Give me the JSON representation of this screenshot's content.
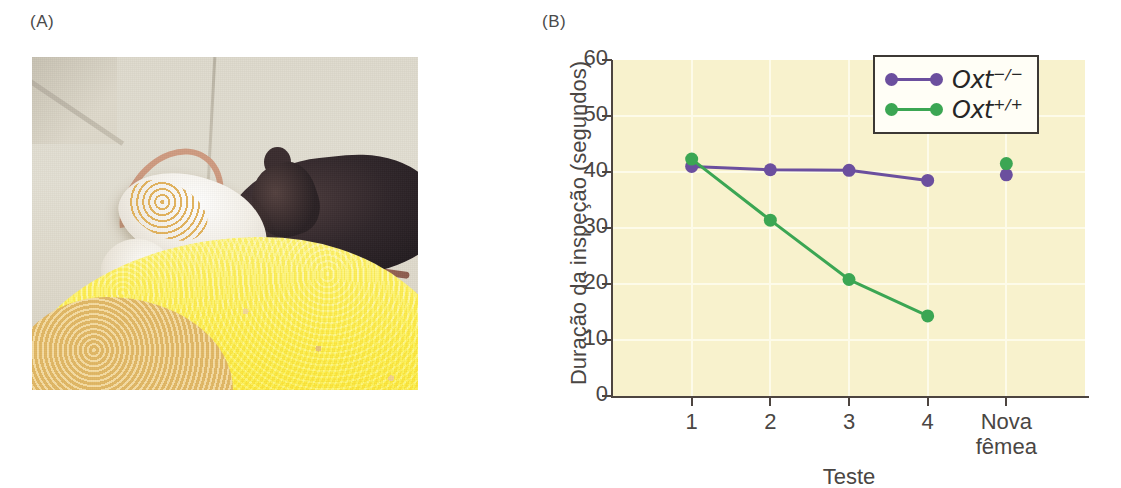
{
  "panels": {
    "a": {
      "label": "(A)",
      "image_description": "Fotografia de um camundongo branco e um camundongo escuro sobre maravalha"
    },
    "b": {
      "label": "(B)"
    }
  },
  "chart_data": {
    "type": "line",
    "title": "",
    "xlabel": "Teste",
    "ylabel": "Duração da inspeção (segundos)",
    "categories": [
      "1",
      "2",
      "3",
      "4",
      "Nova\nfêmea"
    ],
    "xtick_labels": [
      "1",
      "2",
      "3",
      "4",
      "Nova fêmea"
    ],
    "xtick_label_line1": [
      "1",
      "2",
      "3",
      "4",
      "Nova"
    ],
    "xtick_label_line2": [
      "",
      "",
      "",
      "",
      "fêmea"
    ],
    "ylim": [
      0,
      60
    ],
    "yticks": [
      0,
      10,
      20,
      30,
      40,
      50,
      60
    ],
    "ytick_labels": [
      "0",
      "10",
      "20",
      "30",
      "40",
      "50",
      "60"
    ],
    "grid": true,
    "legend_position": "top-right",
    "plot_background": "#f8f2cd",
    "series": [
      {
        "name": "Oxt-/-",
        "label_base": "Oxt",
        "label_sup": "−/−",
        "color": "#6b4f9e",
        "values": [
          41.0,
          40.4,
          40.3,
          38.5,
          39.5
        ],
        "connected_points": 4,
        "isolated_point": {
          "x_index": 4,
          "value": 39.5
        }
      },
      {
        "name": "Oxt+/+",
        "label_base": "Oxt",
        "label_sup": "+/+",
        "color": "#3ba653",
        "values": [
          42.3,
          31.4,
          20.8,
          14.3,
          41.5
        ],
        "connected_points": 4,
        "isolated_point": {
          "x_index": 4,
          "value": 41.5
        }
      }
    ]
  }
}
